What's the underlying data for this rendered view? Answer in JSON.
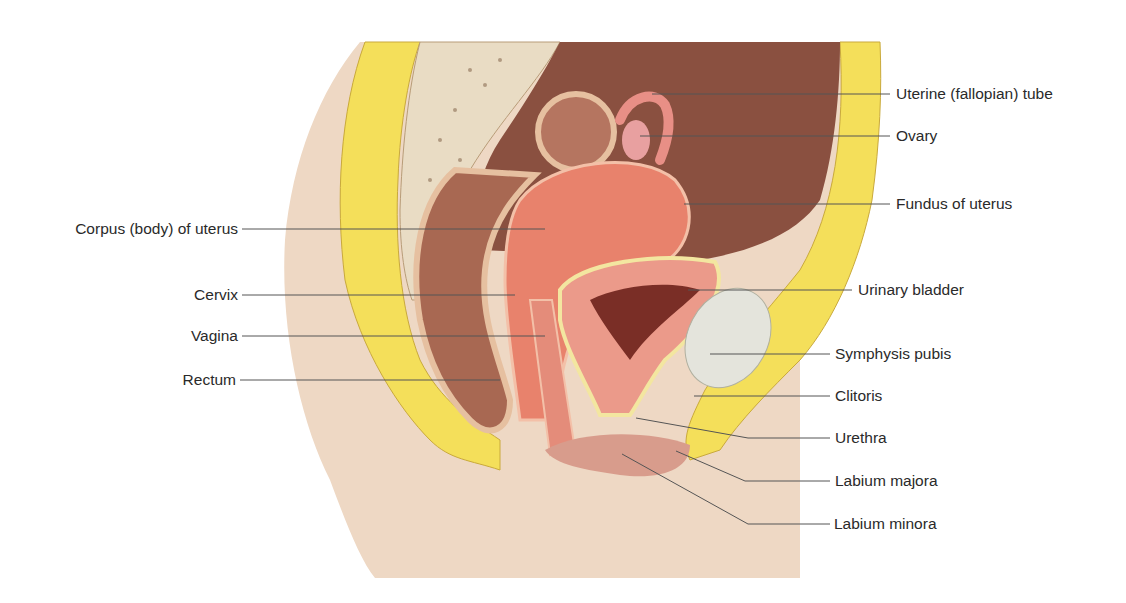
{
  "figure": {
    "colors": {
      "background": "#ffffff",
      "skin": "#eed8c4",
      "fat": "#f4df5a",
      "bone_spongy": "#e9dcc4",
      "cavity": "#8a5040",
      "uterus": "#e8826c",
      "bladder_wall": "#eb9a8a",
      "bladder_lumen": "#7a2e26",
      "cartilage": "#e4e4dc",
      "rectum": "#a86852",
      "leader_line": "#555555",
      "label_text": "#2a2a2a"
    }
  },
  "labels": {
    "left": [
      {
        "text": "Corpus (body) of uterus",
        "y": 229
      },
      {
        "text": "Cervix",
        "y": 295
      },
      {
        "text": "Vagina",
        "y": 336
      },
      {
        "text": "Rectum",
        "y": 380
      }
    ],
    "right": [
      {
        "text": "Uterine (fallopian) tube",
        "y": 94
      },
      {
        "text": "Ovary",
        "y": 136
      },
      {
        "text": "Fundus of uterus",
        "y": 204
      },
      {
        "text": "Urinary bladder",
        "y": 290
      },
      {
        "text": "Symphysis pubis",
        "y": 354
      },
      {
        "text": "Clitoris",
        "y": 396
      },
      {
        "text": "Urethra",
        "y": 438
      },
      {
        "text": "Labium majora",
        "y": 481
      },
      {
        "text": "Labium minora",
        "y": 524
      }
    ]
  }
}
